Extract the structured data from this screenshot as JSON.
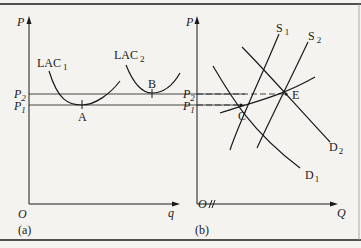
{
  "panel_a": {
    "label": "(a)",
    "y_axis": "P",
    "x_axis": "q",
    "origin": "O",
    "curves": [
      {
        "name": "LAC",
        "sub": "1"
      },
      {
        "name": "LAC",
        "sub": "2"
      }
    ],
    "points": [
      "A",
      "B"
    ],
    "price_levels": [
      {
        "name": "P",
        "sub": "2"
      },
      {
        "name": "P",
        "sub": "1"
      }
    ]
  },
  "panel_b": {
    "label": "(b)",
    "y_axis": "P",
    "x_axis": "Q",
    "origin": "O",
    "curves": [
      {
        "name": "S",
        "sub": "1"
      },
      {
        "name": "S",
        "sub": "2"
      },
      {
        "name": "D",
        "sub": "1"
      },
      {
        "name": "D",
        "sub": "2"
      }
    ],
    "points": [
      "C",
      "E"
    ],
    "price_levels": [
      {
        "name": "P",
        "sub": "2"
      },
      {
        "name": "P",
        "sub": "1"
      }
    ]
  },
  "colors": {
    "line": "#1a1a1a",
    "background": "#f4f3ef"
  }
}
